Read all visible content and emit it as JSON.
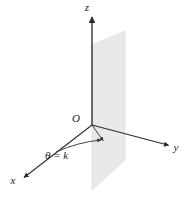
{
  "figure": {
    "kind": "3d-coordinate-axes-with-half-plane",
    "background_color": "#ffffff",
    "caption_text": "",
    "labels": {
      "z_axis": "z",
      "y_axis": "y",
      "x_axis": "x",
      "origin": "O",
      "angle": "θ = k"
    },
    "colors": {
      "axis_stroke": "#2b2b2b",
      "plane_fill": "#e9e9e9",
      "plane_edge": "#d8d8d8",
      "ray_stroke": "#3a3a3a",
      "label_color": "#1a1a1a"
    },
    "geometry": {
      "origin": {
        "x": 92,
        "y": 125
      },
      "z_axis_tip": {
        "x": 92,
        "y": 14
      },
      "y_axis_tip": {
        "x": 171,
        "y": 146
      },
      "x_axis_tip": {
        "x": 22,
        "y": 179
      },
      "theta_ray_tip": {
        "x": 104,
        "y": 142
      },
      "arc_start": {
        "x": 56,
        "y": 152
      },
      "arc_end": {
        "x": 101,
        "y": 140
      },
      "plane_corners": [
        {
          "x": 92,
          "y": 45
        },
        {
          "x": 125,
          "y": 31
        },
        {
          "x": 125,
          "y": 160
        },
        {
          "x": 92,
          "y": 190
        }
      ]
    },
    "label_positions": {
      "z": {
        "x": 87,
        "y": 11
      },
      "y": {
        "x": 176,
        "y": 151
      },
      "x": {
        "x": 13,
        "y": 184
      },
      "O": {
        "x": 76,
        "y": 122
      },
      "theta": {
        "x": 45,
        "y": 159
      }
    }
  }
}
